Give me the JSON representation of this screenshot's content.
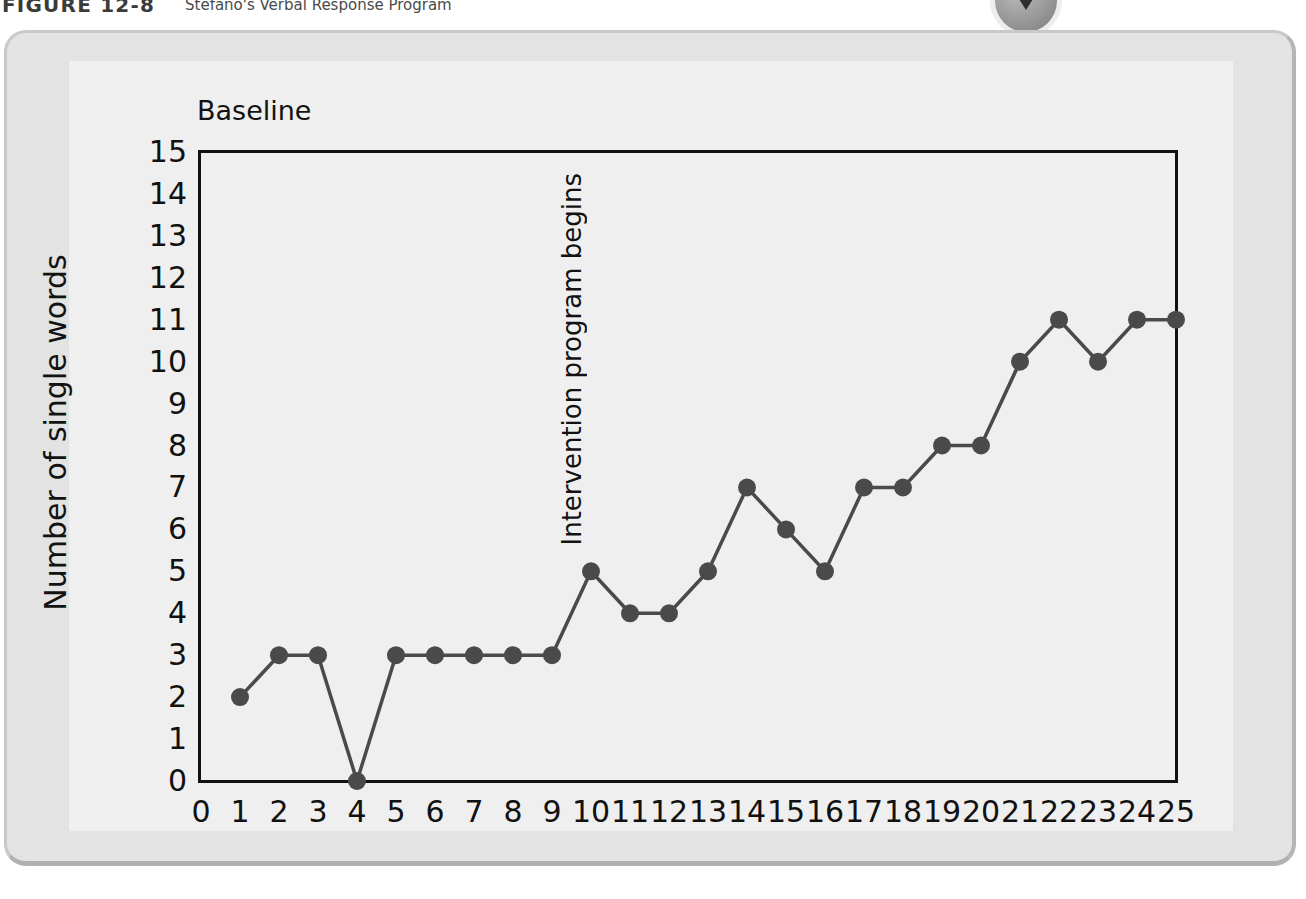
{
  "caption": {
    "figure_label": "FIGURE 12-8",
    "title": "Stefano's Verbal Response Program"
  },
  "badge": {
    "icon": "play-triangle-icon"
  },
  "chart_data": {
    "type": "line",
    "title": "Stefano's Verbal Response Program",
    "xlabel": "",
    "ylabel": "Number of single words",
    "xlim": [
      0,
      25
    ],
    "ylim": [
      0,
      15
    ],
    "grid": false,
    "legend": "none",
    "x_ticks": [
      "0",
      "1",
      "2",
      "3",
      "4",
      "5",
      "6",
      "7",
      "8",
      "9",
      "10",
      "11",
      "12",
      "13",
      "14",
      "15",
      "16",
      "17",
      "18",
      "19",
      "20",
      "21",
      "22",
      "23",
      "24",
      "25"
    ],
    "y_ticks": [
      "15",
      "14",
      "13",
      "12",
      "11",
      "10",
      "9",
      "8",
      "7",
      "6",
      "5",
      "4",
      "3",
      "2",
      "1",
      "0"
    ],
    "annotations": [
      {
        "text": "Baseline",
        "orientation": "horizontal"
      },
      {
        "text": "Intervention program begins",
        "orientation": "vertical",
        "at_x": 9.5
      }
    ],
    "series": [
      {
        "name": "Number of single words",
        "color": "#4a4a4a",
        "x": [
          1,
          2,
          3,
          4,
          5,
          6,
          7,
          8,
          9,
          10,
          11,
          12,
          13,
          14,
          15,
          16,
          17,
          18,
          19,
          20,
          21,
          22,
          23,
          24,
          25
        ],
        "values": [
          2,
          3,
          3,
          0,
          3,
          3,
          3,
          3,
          3,
          5,
          4,
          4,
          5,
          7,
          6,
          5,
          7,
          7,
          8,
          8,
          10,
          11,
          10,
          11,
          11
        ]
      }
    ]
  }
}
